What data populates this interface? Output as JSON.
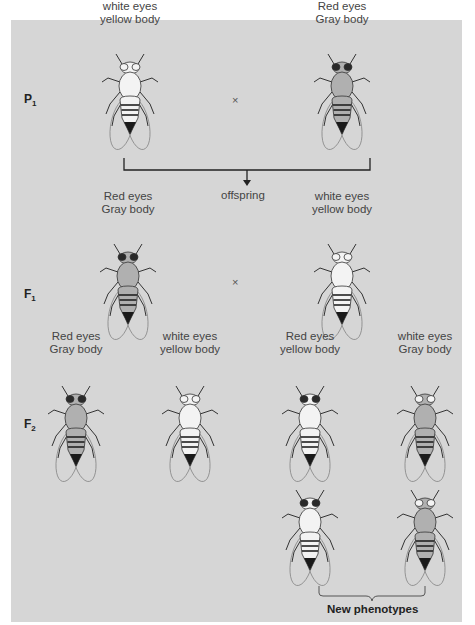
{
  "generations": {
    "p1": {
      "label": "P",
      "sub": "1"
    },
    "f1": {
      "label": "F",
      "sub": "1"
    },
    "f2": {
      "label": "F",
      "sub": "2"
    }
  },
  "cross_symbol": "×",
  "offspring_label": "offspring",
  "new_phenotypes_label": "New phenotypes",
  "colors": {
    "panel_bg": "#d6d6d6",
    "red_eye": "#2a2a2a",
    "white_eye": "#f4f4f4",
    "gray_body": "#b0b0b0",
    "yellow_body": "#f3f3f3"
  },
  "flies": [
    {
      "id": "p1-left",
      "line1": "white eyes",
      "line2": "yellow body",
      "eyes": "white",
      "body": "yellow",
      "x": 98,
      "y": 52
    },
    {
      "id": "p1-right",
      "line1": "Red eyes",
      "line2": "Gray body",
      "eyes": "red",
      "body": "gray",
      "x": 310,
      "y": 52
    },
    {
      "id": "f1-left",
      "line1": "Red eyes",
      "line2": "Gray body",
      "eyes": "red",
      "body": "gray",
      "x": 96,
      "y": 242
    },
    {
      "id": "f1-right",
      "line1": "white eyes",
      "line2": "yellow body",
      "eyes": "white",
      "body": "yellow",
      "x": 310,
      "y": 242
    },
    {
      "id": "f2-1",
      "line1": "Red eyes",
      "line2": "Gray body",
      "eyes": "red",
      "body": "gray",
      "x": 44,
      "y": 384
    },
    {
      "id": "f2-2",
      "line1": "white eyes",
      "line2": "yellow body",
      "eyes": "white",
      "body": "yellow",
      "x": 158,
      "y": 384
    },
    {
      "id": "f2-3",
      "line1": "Red eyes",
      "line2": "yellow body",
      "eyes": "red",
      "body": "yellow",
      "x": 278,
      "y": 384
    },
    {
      "id": "f2-4",
      "line1": "white eyes",
      "line2": "Gray body",
      "eyes": "white",
      "body": "gray",
      "x": 393,
      "y": 384
    },
    {
      "id": "new-1",
      "line1": "",
      "line2": "",
      "eyes": "red",
      "body": "yellow",
      "x": 278,
      "y": 488
    },
    {
      "id": "new-2",
      "line1": "",
      "line2": "",
      "eyes": "white",
      "body": "gray",
      "x": 393,
      "y": 488
    }
  ]
}
